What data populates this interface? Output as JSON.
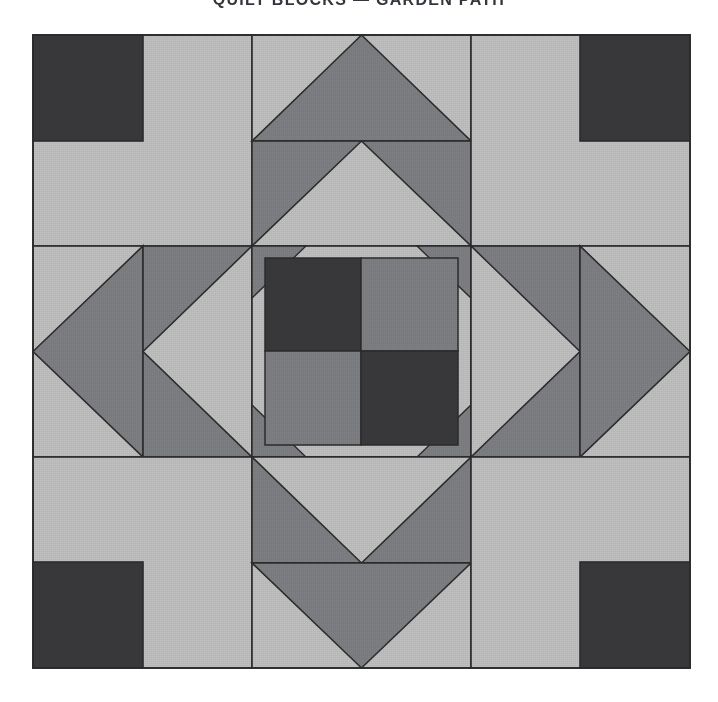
{
  "page": {
    "background_color": "#ffffff",
    "width": 718,
    "height": 702
  },
  "header": {
    "title": "QUILT BLOCKS — GARDEN PATH",
    "visible_fragment": "QUILT BLOCKS — GARDEN PATH",
    "color": "#33373b"
  },
  "figure": {
    "name": "garden-path-quilt-block",
    "block_bounds": {
      "x": 33,
      "y": 35,
      "width": 657,
      "height": 633
    },
    "unit_cols": 3,
    "unit_rows": 3,
    "unit_width": 219,
    "unit_height": 211,
    "seam_line_color": "#2d2d2d",
    "seam_line_width": 1.6
  },
  "palette": {
    "dark": "#3a3a3c",
    "medium": "#7f8184",
    "light": "#c1c2c1",
    "outline": "#2d2d2d",
    "page": "#ffffff"
  },
  "legend": {
    "dark_label": "dark",
    "medium_label": "medium",
    "light_label": "light"
  },
  "units": [
    {
      "name": "corner-top-left",
      "type": "corner",
      "row": 0,
      "col": 0,
      "base_color": "light",
      "accent_color": "dark",
      "accent_position": "top-left"
    },
    {
      "name": "edge-top-center",
      "type": "double-flying-geese",
      "row": 0,
      "col": 1,
      "top_background": "light",
      "top_triangle": "medium",
      "bottom_background": "medium",
      "bottom_triangle": "light",
      "point_direction": "up"
    },
    {
      "name": "corner-top-right",
      "type": "corner",
      "row": 0,
      "col": 2,
      "base_color": "light",
      "accent_color": "dark",
      "accent_position": "top-right"
    },
    {
      "name": "edge-middle-left",
      "type": "double-flying-geese",
      "row": 1,
      "col": 0,
      "outer_background": "light",
      "outer_triangle": "medium",
      "inner_background": "medium",
      "inner_triangle": "light",
      "point_direction": "left"
    },
    {
      "name": "center-four-patch",
      "type": "four-patch-with-diamond",
      "row": 1,
      "col": 1,
      "patch_top_left": "dark",
      "patch_top_right": "medium",
      "patch_bottom_left": "medium",
      "patch_bottom_right": "dark",
      "diamond_corner_color": "medium",
      "note": "center four-patch sits inside the medium diamond formed by the four edge units"
    },
    {
      "name": "edge-middle-right",
      "type": "double-flying-geese",
      "row": 1,
      "col": 2,
      "outer_background": "light",
      "outer_triangle": "medium",
      "inner_background": "medium",
      "inner_triangle": "light",
      "point_direction": "right"
    },
    {
      "name": "corner-bottom-left",
      "type": "corner",
      "row": 2,
      "col": 0,
      "base_color": "light",
      "accent_color": "dark",
      "accent_position": "bottom-left"
    },
    {
      "name": "edge-bottom-center",
      "type": "double-flying-geese",
      "row": 2,
      "col": 1,
      "top_background": "medium",
      "top_triangle": "light",
      "bottom_background": "light",
      "bottom_triangle": "medium",
      "point_direction": "down"
    },
    {
      "name": "corner-bottom-right",
      "type": "corner",
      "row": 2,
      "col": 2,
      "base_color": "light",
      "accent_color": "dark",
      "accent_position": "bottom-right"
    }
  ]
}
